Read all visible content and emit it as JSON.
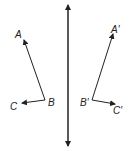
{
  "diagram": {
    "type": "reflection",
    "line_of_reflection": {
      "x": 68,
      "y1": 4,
      "y2": 147,
      "arrows": "both"
    },
    "original": {
      "labels": {
        "A": "A",
        "B": "B",
        "C": "C"
      },
      "points": {
        "A": [
          24,
          40
        ],
        "B": [
          45,
          100
        ],
        "C": [
          22,
          103
        ]
      }
    },
    "image": {
      "labels": {
        "A": "A′",
        "B": "B′",
        "C": "C′"
      },
      "points": {
        "A": [
          113,
          34
        ],
        "B": [
          92,
          100
        ],
        "C": [
          115,
          104
        ]
      }
    },
    "color": "#222222"
  }
}
